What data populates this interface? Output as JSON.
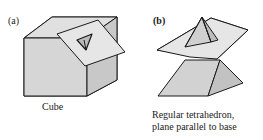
{
  "panel_a": {
    "label": "(a)",
    "caption": "Cube"
  },
  "panel_b": {
    "label": "(b)",
    "caption_line1": "Regular tetrahedron,",
    "caption_line2": "plane parallel to base"
  },
  "colors": {
    "face": "#d6d6d6",
    "face_dark": "#c4c4c4",
    "plane": "#e2e2e2",
    "stroke": "#1a1a1a"
  }
}
